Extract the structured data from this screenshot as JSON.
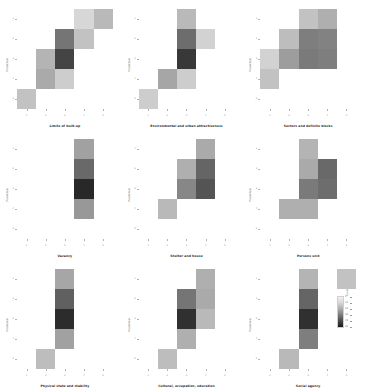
{
  "figure": {
    "kind": "small-multiples-heatmap-grid",
    "rows": 3,
    "columns": 3,
    "background": "#ffffff"
  },
  "colorbar": {
    "title": "Count",
    "ticks": [
      "0",
      "10",
      "20",
      "30",
      "40",
      "50"
    ],
    "low_color": "#f2f2f2",
    "high_color": "#1a1a1a",
    "orientation": "vertical"
  },
  "axes": {
    "xlabel": "",
    "ylabel": "Predicted",
    "xticklabels": [
      "1",
      "2",
      "3",
      "4",
      "5"
    ],
    "yticklabels": [
      "1",
      "2",
      "3",
      "4",
      "5"
    ]
  },
  "chart_data": {
    "type": "heatmap",
    "title": "",
    "xlabel": "",
    "ylabel": "Predicted",
    "categories": [
      "1",
      "2",
      "3",
      "4",
      "5"
    ],
    "colormap": "Greys",
    "vmin": 0,
    "vmax": 50,
    "grid": false,
    "legend_position": "bottom-right",
    "panels": [
      {
        "title": "Limits of built-up",
        "xlabel": "",
        "ylabel": "Predicted",
        "xticklabels": [
          "1",
          "2",
          "3",
          "4",
          "5"
        ],
        "yticklabels": [
          "1",
          "2",
          "3",
          "4",
          "5"
        ],
        "matrix": [
          [
            0,
            0,
            0,
            5,
            11
          ],
          [
            0,
            0,
            26,
            9,
            0
          ],
          [
            0,
            12,
            38,
            0,
            0
          ],
          [
            0,
            14,
            7,
            0,
            0
          ],
          [
            9,
            0,
            0,
            0,
            0
          ]
        ]
      },
      {
        "title": "Environmental and urban attractiveness",
        "xlabel": "",
        "ylabel": "Predicted",
        "xticklabels": [
          "1",
          "2",
          "3",
          "4",
          "5"
        ],
        "yticklabels": [
          "1",
          "2",
          "3",
          "4",
          "5"
        ],
        "matrix": [
          [
            0,
            0,
            11,
            0,
            0
          ],
          [
            0,
            0,
            28,
            6,
            0
          ],
          [
            0,
            0,
            41,
            0,
            0
          ],
          [
            0,
            15,
            7,
            0,
            0
          ],
          [
            7,
            0,
            0,
            0,
            0
          ]
        ]
      },
      {
        "title": "Sectors and definite blocks",
        "xlabel": "",
        "ylabel": "Predicted",
        "xticklabels": [
          "1",
          "2",
          "3",
          "4",
          "5"
        ],
        "yticklabels": [
          "1",
          "2",
          "3",
          "4",
          "5"
        ],
        "matrix": [
          [
            0,
            0,
            9,
            13,
            0
          ],
          [
            0,
            10,
            24,
            23,
            0
          ],
          [
            6,
            17,
            25,
            24,
            0
          ],
          [
            9,
            0,
            0,
            0,
            0
          ],
          [
            0,
            0,
            0,
            0,
            0
          ]
        ]
      },
      {
        "title": "Vacancy",
        "xlabel": "",
        "ylabel": "Predicted",
        "xticklabels": [
          "1",
          "2",
          "3",
          "4",
          "5"
        ],
        "yticklabels": [
          "1",
          "2",
          "3",
          "4",
          "5"
        ],
        "matrix": [
          [
            0,
            0,
            0,
            16,
            0
          ],
          [
            0,
            0,
            0,
            29,
            0
          ],
          [
            0,
            0,
            0,
            45,
            0
          ],
          [
            0,
            0,
            0,
            18,
            0
          ],
          [
            0,
            0,
            0,
            0,
            0
          ]
        ]
      },
      {
        "title": "Shelter and house",
        "xlabel": "",
        "ylabel": "Predicted",
        "xticklabels": [
          "1",
          "2",
          "3",
          "4",
          "5"
        ],
        "yticklabels": [
          "1",
          "2",
          "3",
          "4",
          "5"
        ],
        "matrix": [
          [
            0,
            0,
            0,
            14,
            0
          ],
          [
            0,
            0,
            13,
            30,
            0
          ],
          [
            0,
            0,
            22,
            34,
            0
          ],
          [
            0,
            11,
            0,
            0,
            0
          ],
          [
            0,
            0,
            0,
            0,
            0
          ]
        ]
      },
      {
        "title": "Persons unit",
        "xlabel": "",
        "ylabel": "Predicted",
        "xticklabels": [
          "1",
          "2",
          "3",
          "4",
          "5"
        ],
        "yticklabels": [
          "1",
          "2",
          "3",
          "4",
          "5"
        ],
        "matrix": [
          [
            0,
            0,
            12,
            0,
            0
          ],
          [
            0,
            0,
            14,
            29,
            0
          ],
          [
            0,
            0,
            25,
            28,
            0
          ],
          [
            0,
            13,
            13,
            0,
            0
          ],
          [
            0,
            0,
            0,
            0,
            0
          ]
        ]
      },
      {
        "title": "Physical state and stability",
        "xlabel": "",
        "ylabel": "Predicted",
        "xticklabels": [
          "1",
          "2",
          "3",
          "4",
          "5"
        ],
        "yticklabels": [
          "1",
          "2",
          "3",
          "4",
          "5"
        ],
        "matrix": [
          [
            0,
            0,
            15,
            0,
            0
          ],
          [
            0,
            0,
            31,
            0,
            0
          ],
          [
            0,
            0,
            44,
            0,
            0
          ],
          [
            0,
            0,
            16,
            0,
            0
          ],
          [
            0,
            10,
            0,
            0,
            0
          ]
        ]
      },
      {
        "title": "Cultural, occupation, education",
        "xlabel": "",
        "ylabel": "Predicted",
        "xticklabels": [
          "1",
          "2",
          "3",
          "4",
          "5"
        ],
        "yticklabels": [
          "1",
          "2",
          "3",
          "4",
          "5"
        ],
        "matrix": [
          [
            0,
            0,
            0,
            13,
            0
          ],
          [
            0,
            0,
            26,
            14,
            0
          ],
          [
            0,
            0,
            43,
            11,
            0
          ],
          [
            0,
            0,
            13,
            0,
            0
          ],
          [
            0,
            10,
            0,
            0,
            0
          ]
        ]
      },
      {
        "title": "Social agency",
        "xlabel": "",
        "ylabel": "Predicted",
        "xticklabels": [
          "1",
          "2",
          "3",
          "4",
          "5"
        ],
        "yticklabels": [
          "1",
          "2",
          "3",
          "4",
          "5"
        ],
        "matrix": [
          [
            0,
            0,
            12,
            0,
            9
          ],
          [
            0,
            0,
            30,
            0,
            0
          ],
          [
            0,
            0,
            43,
            0,
            0
          ],
          [
            0,
            0,
            24,
            0,
            0
          ],
          [
            0,
            11,
            0,
            0,
            0
          ]
        ]
      }
    ]
  }
}
